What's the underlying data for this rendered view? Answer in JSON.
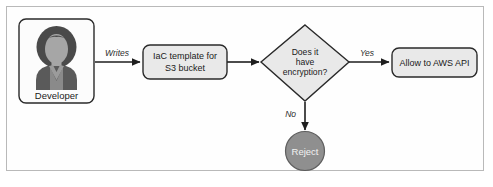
{
  "diagram": {
    "colors": {
      "node_fill": "#e9e9e9",
      "node_stroke": "#2a2a2a",
      "frame_stroke": "#b9b9b9",
      "edge_stroke": "#1e1e1e",
      "terminal_fill": "#8f8f8f",
      "terminal_text": "#f2f2f2",
      "avatar_hair": "#4a4a4a",
      "avatar_face": "#a6a6a6",
      "avatar_body": "#5a5a5a",
      "avatar_shirt": "#9b9b9b",
      "page_bg": "#ffffff"
    },
    "nodes": [
      {
        "id": "developer",
        "shape": "rounded-rect",
        "label": "Developer",
        "icon": "person-avatar-icon"
      },
      {
        "id": "iac-template",
        "shape": "rounded-rect",
        "label_line1": "IaC template for",
        "label_line2": "S3 bucket"
      },
      {
        "id": "encryption-decision",
        "shape": "diamond",
        "label_line1": "Does it",
        "label_line2": "have",
        "label_line3": "encryption?"
      },
      {
        "id": "allow-aws-api",
        "shape": "rounded-rect",
        "label": "Allow to AWS API"
      },
      {
        "id": "reject",
        "shape": "circle",
        "label": "Reject"
      }
    ],
    "edges": [
      {
        "id": "developer-to-iac",
        "from": "developer",
        "to": "iac-template",
        "label": "Writes"
      },
      {
        "id": "iac-to-decision",
        "from": "iac-template",
        "to": "encryption-decision",
        "label": ""
      },
      {
        "id": "decision-to-allow",
        "from": "encryption-decision",
        "to": "allow-aws-api",
        "label": "Yes"
      },
      {
        "id": "decision-to-reject",
        "from": "encryption-decision",
        "to": "reject",
        "label": "No"
      }
    ]
  }
}
